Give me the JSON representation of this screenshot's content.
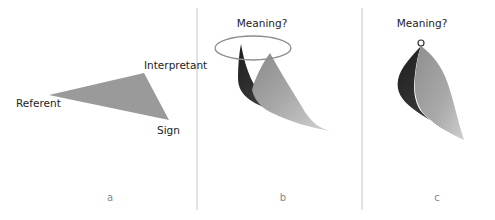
{
  "panels": [
    {
      "id": "a",
      "letter": "a",
      "vertices": {
        "referent": "Referent",
        "interpretant": "Interpretant",
        "sign": "Sign"
      }
    },
    {
      "id": "b",
      "letter": "b",
      "caption": "Meaning?"
    },
    {
      "id": "c",
      "letter": "c",
      "caption": "Meaning?"
    }
  ],
  "colors": {
    "triangle_fill": "#9a9a9a",
    "divider": "#c8c8c8",
    "ellipse_stroke": "#8c8c8c",
    "dark_surface": "#2a2a2a",
    "light_surface": "#a8a8a8",
    "letter": "#8a8a8a"
  }
}
